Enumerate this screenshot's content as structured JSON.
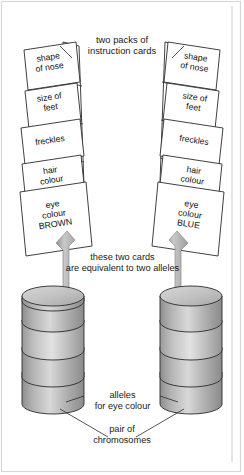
{
  "figure": {
    "background_color": "#ffffff",
    "ink_color": "#1a1a1a",
    "arrow_color": "#9a9a9a"
  },
  "annotations": {
    "header": "two packs of\ninstruction cards",
    "equivalent": "these two cards\nare equivalent to two alleles",
    "alleles": "alleles\nfor eye colour",
    "pair": "pair of\nchromosomes"
  },
  "left_pack": {
    "name": "left pack of instruction cards",
    "cards": [
      {
        "label": "shape\nof nose"
      },
      {
        "label": "size of\nfeet"
      },
      {
        "label": "freckles"
      },
      {
        "label": "hair\ncolour"
      },
      {
        "label": "eye\ncolour\nBROWN"
      }
    ]
  },
  "right_pack": {
    "name": "right pack of instruction cards",
    "cards": [
      {
        "label": "shape\nof nose"
      },
      {
        "label": "size of\nfeet"
      },
      {
        "label": "freckles"
      },
      {
        "label": "hair\ncolour"
      },
      {
        "label": "eye\ncolour\nBLUE"
      }
    ]
  },
  "chromosomes": {
    "count": 2,
    "bands_per_chromosome": 5,
    "left_label": "left chromosome",
    "right_label": "right chromosome",
    "band_shades": [
      "#b8b8b8",
      "#a8a8a8",
      "#d2d2d2",
      "#bdbdbd",
      "#9e9e9e"
    ]
  }
}
